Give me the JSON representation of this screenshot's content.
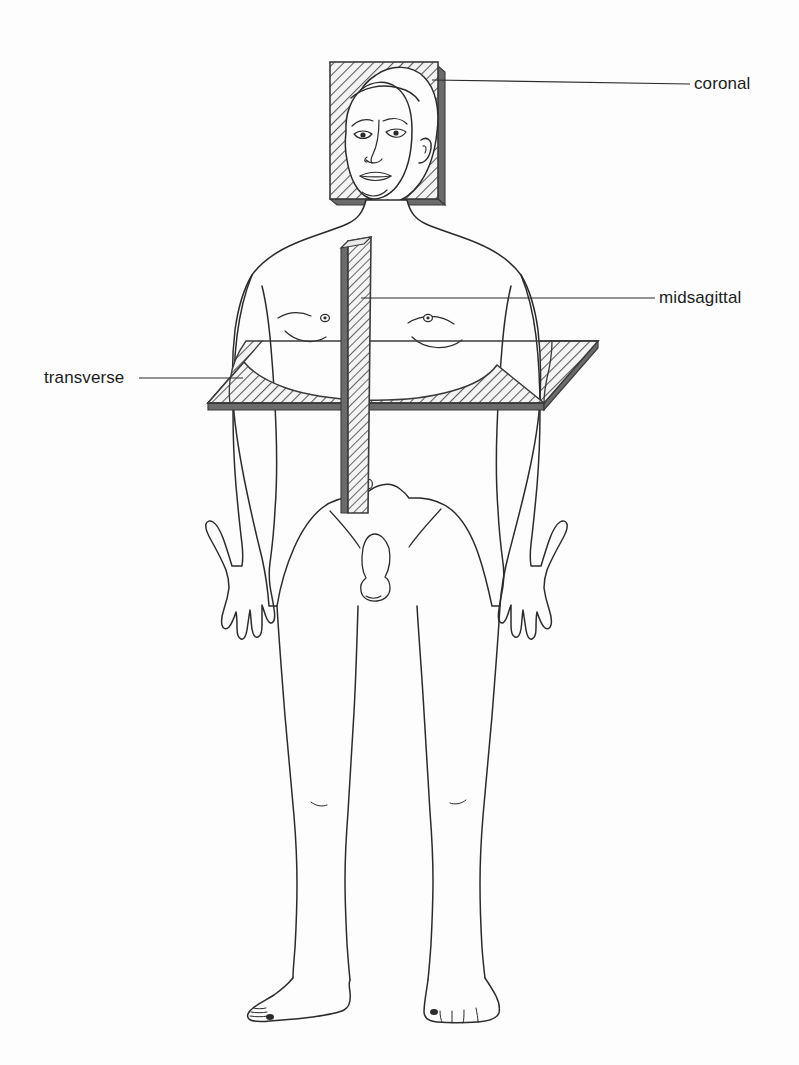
{
  "figure": {
    "style": "line-drawing-with-hatched-planes",
    "background_color": "#fdfdfd",
    "ink_color": "#2b2b2b",
    "hatch_color": "#555555",
    "plane_edge_color": "#3a3a3a",
    "plane_fill_color": "#f2f2f2"
  },
  "labels": [
    {
      "id": "coronal",
      "text": "coronal",
      "text_x": 694,
      "text_y": 75,
      "leader_from_x": 690,
      "leader_from_y": 84,
      "leader_to_x": 432,
      "leader_to_y": 80,
      "anchor": "coronal-plane"
    },
    {
      "id": "midsagittal",
      "text": "midsagittal",
      "text_x": 659,
      "text_y": 289,
      "leader_from_x": 655,
      "leader_from_y": 298,
      "leader_to_x": 361,
      "leader_to_y": 298,
      "anchor": "midsagittal-plane"
    },
    {
      "id": "transverse",
      "text": "transverse",
      "text_x": 44,
      "text_y": 369,
      "leader_from_x": 139,
      "leader_from_y": 378,
      "leader_to_x": 243,
      "leader_to_y": 378,
      "anchor": "transverse-plane"
    }
  ],
  "planes": [
    {
      "id": "coronal-plane",
      "name": "coronal",
      "shape": "rectangle-behind-head",
      "orientation": "frontal-vertical",
      "bounds": {
        "x": 330,
        "y": 62,
        "width": 115,
        "height": 143
      },
      "hatch_angle_deg": 45
    },
    {
      "id": "midsagittal-plane",
      "name": "midsagittal",
      "shape": "narrow-vertical-slab",
      "orientation": "sagittal-vertical",
      "bounds": {
        "x": 341,
        "y": 237,
        "width": 30,
        "height": 277
      },
      "hatch_angle_deg": 45
    },
    {
      "id": "transverse-plane",
      "name": "transverse",
      "shape": "horizontal-parallelogram",
      "orientation": "horizontal-axial",
      "bounds": {
        "x": 208,
        "y": 341,
        "width": 390,
        "height": 62
      },
      "hatch_angle_deg": 45
    }
  ]
}
